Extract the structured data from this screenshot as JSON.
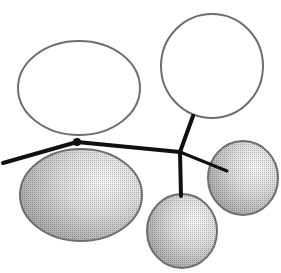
{
  "diagram": {
    "type": "orbital-lobe-diagram",
    "colors": {
      "background": "#ffffff",
      "outline": "#6e6e6e",
      "bond": "#111111",
      "shade_dark": "#a8a8a8",
      "shade_light": "#f4f4f4",
      "open_fill": "#ffffff"
    },
    "atoms": [
      {
        "id": "left-atom",
        "x": 77,
        "y": 142,
        "r": 4
      },
      {
        "id": "center-atom",
        "x": 180,
        "y": 152,
        "r": 2.5
      }
    ],
    "bonds": [
      {
        "id": "bond-left-substituent",
        "x1": 3,
        "y1": 163,
        "x2": 77,
        "y2": 142,
        "width": 4
      },
      {
        "id": "bond-center",
        "x1": 77,
        "y1": 142,
        "x2": 180,
        "y2": 152,
        "width": 4
      },
      {
        "id": "bond-to-top-right",
        "x1": 180,
        "y1": 152,
        "x2": 193,
        "y2": 116,
        "width": 4
      },
      {
        "id": "bond-to-bottom",
        "x1": 180,
        "y1": 152,
        "x2": 181,
        "y2": 196,
        "width": 4
      },
      {
        "id": "bond-to-right",
        "x1": 180,
        "y1": 152,
        "x2": 227,
        "y2": 171,
        "width": 3
      }
    ],
    "lobes": [
      {
        "id": "lobe-upper-left",
        "shaded": false,
        "cx": 79,
        "cy": 88,
        "rx": 61,
        "ry": 47
      },
      {
        "id": "lobe-lower-left",
        "shaded": true,
        "cx": 81,
        "cy": 195,
        "rx": 61,
        "ry": 46
      },
      {
        "id": "lobe-top-right",
        "shaded": false,
        "cx": 212,
        "cy": 66,
        "rx": 51,
        "ry": 52
      },
      {
        "id": "lobe-right",
        "shaded": true,
        "cx": 243,
        "cy": 178,
        "rx": 35,
        "ry": 37
      },
      {
        "id": "lobe-bottom",
        "shaded": true,
        "cx": 182,
        "cy": 231,
        "rx": 35,
        "ry": 37
      }
    ]
  }
}
